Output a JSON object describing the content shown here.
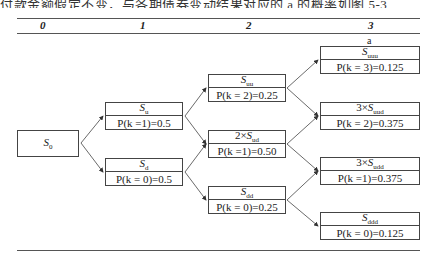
{
  "header_text": "付款金额假定不变，与各期债券变动结果对应的 a 的概率如图 5-3",
  "columns": [
    {
      "label": "0"
    },
    {
      "label": "1"
    },
    {
      "label": "2"
    },
    {
      "label": "3"
    }
  ],
  "annotation": "a",
  "nodes": {
    "s0": {
      "prefix": "",
      "symbol": "S",
      "sub": "0",
      "prob": ""
    },
    "su": {
      "prefix": "",
      "symbol": "S",
      "sub": "u",
      "prob": "P(k =1)=0.5"
    },
    "sd": {
      "prefix": "",
      "symbol": "S",
      "sub": "d",
      "prob": "P(k = 0)=0.5"
    },
    "suu": {
      "prefix": "",
      "symbol": "S",
      "sub": "uu",
      "prob": "P(k = 2)=0.25"
    },
    "sud": {
      "prefix": "2×",
      "symbol": "S",
      "sub": "ud",
      "prob": "P(k =1)=0.50"
    },
    "sdd": {
      "prefix": "",
      "symbol": "S",
      "sub": "dd",
      "prob": "P(k = 0)=0.25"
    },
    "suuu": {
      "prefix": "",
      "symbol": "S",
      "sub": "uuu",
      "prob": "P(k = 3)=0.125"
    },
    "suud": {
      "prefix": "3×",
      "symbol": "S",
      "sub": "uud",
      "prob": "P(k = 2)=0.375"
    },
    "sudd": {
      "prefix": "3×",
      "symbol": "S",
      "sub": "udd",
      "prob": "P(k =1)=0.375"
    },
    "sddd": {
      "prefix": "",
      "symbol": "S",
      "sub": "ddd",
      "prob": "P(k = 0)=0.125"
    }
  },
  "colors": {
    "line": "#444444",
    "text": "#222222",
    "background": "#ffffff"
  }
}
